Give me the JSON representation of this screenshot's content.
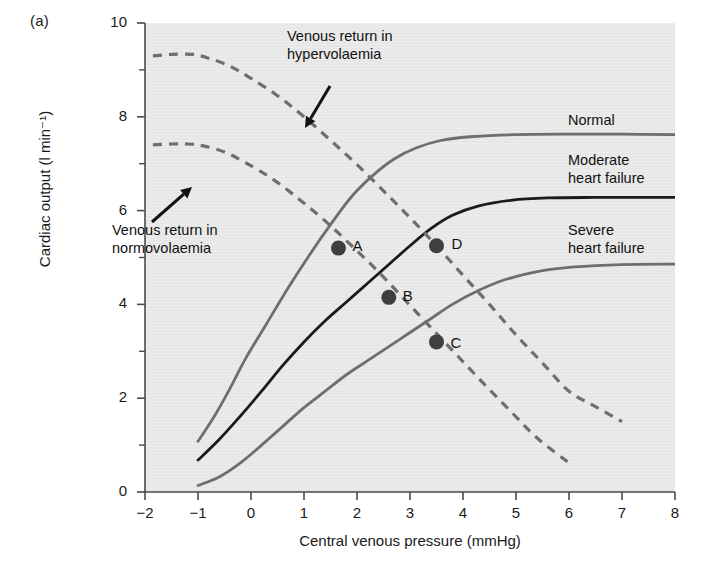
{
  "panel": {
    "label": "(a)"
  },
  "chart_data": {
    "type": "line",
    "title": "",
    "xlabel": "Central venous pressure (mmHg)",
    "ylabel": "Cardiac output (l min⁻¹)",
    "xlim": [
      -2,
      8
    ],
    "ylim": [
      0,
      10
    ],
    "xticks": [
      "−2",
      "−1",
      "0",
      "1",
      "2",
      "3",
      "4",
      "5",
      "6",
      "7",
      "8"
    ],
    "xtick_values": [
      -2,
      -1,
      0,
      1,
      2,
      3,
      4,
      5,
      6,
      7,
      8
    ],
    "yticks": [
      "0",
      "2",
      "4",
      "6",
      "8",
      "10"
    ],
    "ytick_values": [
      0,
      2,
      4,
      6,
      8,
      10
    ],
    "yminor_values": [
      1,
      3,
      5,
      7,
      9
    ],
    "grid": false,
    "legend_position": "inline-right",
    "plot_background": "#ececec",
    "series": [
      {
        "name": "Normal",
        "style": "solid",
        "color": "#6e6e6e",
        "label_text": "Normal",
        "points": [
          [
            -1.0,
            1.08
          ],
          [
            -0.7,
            1.6
          ],
          [
            -0.4,
            2.2
          ],
          [
            -0.1,
            2.85
          ],
          [
            0.3,
            3.6
          ],
          [
            0.7,
            4.35
          ],
          [
            1.1,
            5.05
          ],
          [
            1.5,
            5.7
          ],
          [
            1.9,
            6.3
          ],
          [
            2.3,
            6.75
          ],
          [
            2.7,
            7.1
          ],
          [
            3.1,
            7.33
          ],
          [
            3.6,
            7.5
          ],
          [
            4.2,
            7.58
          ],
          [
            5.0,
            7.62
          ],
          [
            6.0,
            7.63
          ],
          [
            7.0,
            7.63
          ],
          [
            8.0,
            7.62
          ]
        ]
      },
      {
        "name": "Moderate heart failure",
        "style": "solid",
        "color": "#1a1a1a",
        "label_text": "Moderate\nheart failure",
        "points": [
          [
            -1.0,
            0.68
          ],
          [
            -0.6,
            1.12
          ],
          [
            -0.2,
            1.62
          ],
          [
            0.2,
            2.15
          ],
          [
            0.6,
            2.7
          ],
          [
            1.0,
            3.2
          ],
          [
            1.4,
            3.65
          ],
          [
            1.8,
            4.05
          ],
          [
            2.2,
            4.45
          ],
          [
            2.6,
            4.85
          ],
          [
            3.0,
            5.25
          ],
          [
            3.4,
            5.62
          ],
          [
            3.8,
            5.9
          ],
          [
            4.3,
            6.1
          ],
          [
            4.9,
            6.22
          ],
          [
            5.6,
            6.27
          ],
          [
            6.5,
            6.28
          ],
          [
            8.0,
            6.28
          ]
        ]
      },
      {
        "name": "Severe heart failure",
        "style": "solid",
        "color": "#6e6e6e",
        "label_text": "Severe\nheart failure",
        "points": [
          [
            -1.0,
            0.14
          ],
          [
            -0.6,
            0.32
          ],
          [
            -0.2,
            0.62
          ],
          [
            0.2,
            1.0
          ],
          [
            0.6,
            1.4
          ],
          [
            1.0,
            1.8
          ],
          [
            1.4,
            2.15
          ],
          [
            1.8,
            2.5
          ],
          [
            2.2,
            2.8
          ],
          [
            2.6,
            3.1
          ],
          [
            3.0,
            3.4
          ],
          [
            3.4,
            3.7
          ],
          [
            3.8,
            4.0
          ],
          [
            4.3,
            4.3
          ],
          [
            4.8,
            4.53
          ],
          [
            5.4,
            4.7
          ],
          [
            6.1,
            4.8
          ],
          [
            7.0,
            4.85
          ],
          [
            8.0,
            4.86
          ]
        ]
      },
      {
        "name": "Venous return in normovolaemia",
        "style": "dashed",
        "color": "#6e6e6e",
        "points": [
          [
            -1.85,
            7.4
          ],
          [
            -1.5,
            7.42
          ],
          [
            -1.2,
            7.42
          ],
          [
            -0.9,
            7.38
          ],
          [
            -0.5,
            7.25
          ],
          [
            -0.1,
            7.02
          ],
          [
            0.4,
            6.68
          ],
          [
            0.9,
            6.25
          ],
          [
            1.4,
            5.78
          ],
          [
            1.9,
            5.25
          ],
          [
            2.4,
            4.7
          ],
          [
            2.9,
            4.1
          ],
          [
            3.4,
            3.5
          ],
          [
            3.9,
            2.9
          ],
          [
            4.4,
            2.3
          ],
          [
            4.9,
            1.72
          ],
          [
            5.4,
            1.15
          ],
          [
            6.0,
            0.62
          ]
        ]
      },
      {
        "name": "Venous return in hypervolaemia",
        "style": "dashed",
        "color": "#6e6e6e",
        "points": [
          [
            -1.85,
            9.3
          ],
          [
            -1.5,
            9.33
          ],
          [
            -1.1,
            9.33
          ],
          [
            -0.8,
            9.25
          ],
          [
            -0.4,
            9.08
          ],
          [
            0.0,
            8.82
          ],
          [
            0.5,
            8.45
          ],
          [
            1.0,
            8.0
          ],
          [
            1.5,
            7.5
          ],
          [
            2.0,
            6.98
          ],
          [
            2.5,
            6.42
          ],
          [
            3.0,
            5.85
          ],
          [
            3.5,
            5.25
          ],
          [
            4.0,
            4.62
          ],
          [
            4.5,
            4.0
          ],
          [
            5.0,
            3.35
          ],
          [
            5.5,
            2.75
          ],
          [
            6.0,
            2.15
          ],
          [
            6.5,
            1.82
          ],
          [
            7.0,
            1.5
          ]
        ]
      }
    ],
    "markers": [
      {
        "label": "A",
        "x": 1.65,
        "y": 5.2
      },
      {
        "label": "B",
        "x": 2.6,
        "y": 4.15
      },
      {
        "label": "C",
        "x": 3.5,
        "y": 3.2
      },
      {
        "label": "D",
        "x": 3.5,
        "y": 5.25
      }
    ],
    "annotations": [
      {
        "name": "hypervolaemia-annotation",
        "lines": [
          "Venous return in",
          "hypervolaemia"
        ],
        "text_x": 287,
        "text_y": 28,
        "arrow": {
          "x1": 330,
          "y1": 86,
          "x2": 305,
          "y2": 128
        }
      },
      {
        "name": "normovolaemia-annotation",
        "lines": [
          "Venous return in",
          "normovolaemia"
        ],
        "text_x": 112,
        "text_y": 222,
        "arrow": {
          "x1": 152,
          "y1": 222,
          "x2": 192,
          "y2": 187
        }
      }
    ]
  }
}
